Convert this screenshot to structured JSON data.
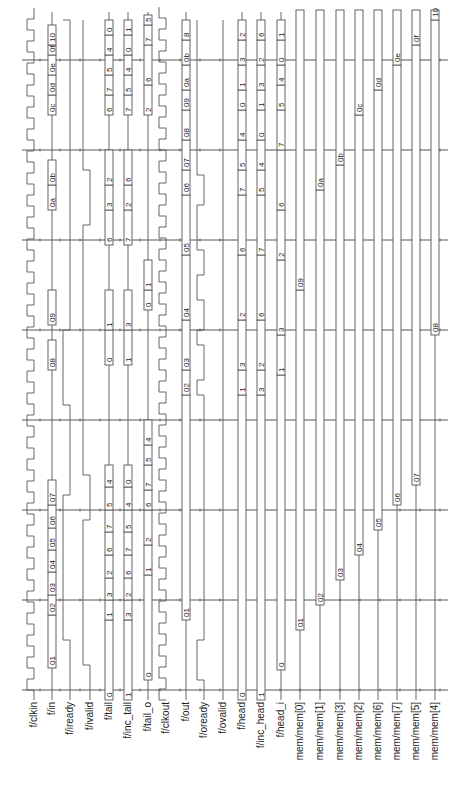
{
  "diagram": {
    "type": "timing-waveform",
    "orientation": "rotated-90-ccw",
    "time_axis_y_bottom": 690,
    "time_axis_y_top": 55,
    "cycle_height": 45,
    "grid_lines_y": [
      690,
      600,
      510,
      420,
      330,
      240,
      150,
      60
    ],
    "label_y": 700,
    "signals": [
      {
        "name": "f/clkin",
        "x": 34,
        "kind": "clock",
        "offset": 0
      },
      {
        "name": "f/in",
        "x": 52,
        "kind": "bus",
        "values": [
          {
            "v": "01",
            "y0": 668,
            "y1": 615
          },
          {
            "v": "02",
            "y0": 615,
            "y1": 595
          },
          {
            "v": "03",
            "y0": 595,
            "y1": 572
          },
          {
            "v": "04",
            "y0": 572,
            "y1": 550
          },
          {
            "v": "05",
            "y0": 550,
            "y1": 528
          },
          {
            "v": "06",
            "y0": 528,
            "y1": 505
          },
          {
            "v": "07",
            "y0": 505,
            "y1": 480
          },
          {
            "v": "08",
            "y0": 370,
            "y1": 340
          },
          {
            "v": "09",
            "y0": 325,
            "y1": 290
          },
          {
            "v": "0a",
            "y0": 210,
            "y1": 185
          },
          {
            "v": "0b",
            "y0": 185,
            "y1": 160
          },
          {
            "v": "0c",
            "y0": 115,
            "y1": 95
          },
          {
            "v": "0d",
            "y0": 95,
            "y1": 75
          },
          {
            "v": "0e",
            "y0": 75,
            "y1": 55
          },
          {
            "v": "0f",
            "y0": 55,
            "y1": 45
          },
          {
            "v": "10",
            "y0": 45,
            "y1": 25
          }
        ]
      },
      {
        "name": "f/iready",
        "x": 70,
        "kind": "level"
      },
      {
        "name": "f/ivalid",
        "x": 90,
        "kind": "level"
      },
      {
        "name": "f/tail",
        "x": 109,
        "kind": "bus",
        "values": [
          {
            "v": "0",
            "y0": 700,
            "y1": 620
          },
          {
            "v": "1",
            "y0": 620,
            "y1": 600
          },
          {
            "v": "3",
            "y0": 600,
            "y1": 578
          },
          {
            "v": "2",
            "y0": 578,
            "y1": 555
          },
          {
            "v": "6",
            "y0": 555,
            "y1": 532
          },
          {
            "v": "7",
            "y0": 532,
            "y1": 510
          },
          {
            "v": "5",
            "y0": 510,
            "y1": 487
          },
          {
            "v": "4",
            "y0": 487,
            "y1": 465
          },
          {
            "v": "0",
            "y0": 365,
            "y1": 330
          },
          {
            "v": "1",
            "y0": 330,
            "y1": 290
          },
          {
            "v": "6",
            "y0": 245,
            "y1": 210
          },
          {
            "v": "3",
            "y0": 210,
            "y1": 185
          },
          {
            "v": "2",
            "y0": 185,
            "y1": 150
          },
          {
            "v": "6",
            "y0": 115,
            "y1": 95
          },
          {
            "v": "7",
            "y0": 95,
            "y1": 75
          },
          {
            "v": "5",
            "y0": 75,
            "y1": 55
          },
          {
            "v": "4",
            "y0": 55,
            "y1": 35
          },
          {
            "v": "0",
            "y0": 35,
            "y1": 20
          }
        ]
      },
      {
        "name": "f/inc_tail",
        "x": 128,
        "kind": "bus",
        "values": [
          {
            "v": "1",
            "y0": 700,
            "y1": 620
          },
          {
            "v": "3",
            "y0": 620,
            "y1": 600
          },
          {
            "v": "2",
            "y0": 600,
            "y1": 578
          },
          {
            "v": "6",
            "y0": 578,
            "y1": 555
          },
          {
            "v": "7",
            "y0": 555,
            "y1": 532
          },
          {
            "v": "5",
            "y0": 532,
            "y1": 510
          },
          {
            "v": "4",
            "y0": 510,
            "y1": 487
          },
          {
            "v": "0",
            "y0": 487,
            "y1": 465
          },
          {
            "v": "1",
            "y0": 365,
            "y1": 330
          },
          {
            "v": "3",
            "y0": 330,
            "y1": 290
          },
          {
            "v": "7",
            "y0": 245,
            "y1": 210
          },
          {
            "v": "2",
            "y0": 210,
            "y1": 185
          },
          {
            "v": "6",
            "y0": 185,
            "y1": 150
          },
          {
            "v": "7",
            "y0": 115,
            "y1": 95
          },
          {
            "v": "5",
            "y0": 95,
            "y1": 75
          },
          {
            "v": "4",
            "y0": 75,
            "y1": 55
          },
          {
            "v": "0",
            "y0": 55,
            "y1": 35
          },
          {
            "v": "1",
            "y0": 35,
            "y1": 20
          }
        ]
      },
      {
        "name": "f/tail_o",
        "x": 148,
        "kind": "bus",
        "values": [
          {
            "v": "0",
            "y0": 680,
            "y1": 575
          },
          {
            "v": "1",
            "y0": 575,
            "y1": 545
          },
          {
            "v": "2",
            "y0": 545,
            "y1": 510
          },
          {
            "v": "6",
            "y0": 510,
            "y1": 490
          },
          {
            "v": "7",
            "y0": 490,
            "y1": 465
          },
          {
            "v": "5",
            "y0": 465,
            "y1": 445
          },
          {
            "v": "4",
            "y0": 445,
            "y1": 420
          },
          {
            "v": "0",
            "y0": 310,
            "y1": 290
          },
          {
            "v": "1",
            "y0": 290,
            "y1": 260
          },
          {
            "v": "2",
            "y0": 115,
            "y1": 85
          },
          {
            "v": "6",
            "y0": 85,
            "y1": 45
          },
          {
            "v": "7",
            "y0": 45,
            "y1": 25
          },
          {
            "v": "5",
            "y0": 25,
            "y1": 15
          }
        ]
      },
      {
        "name": "f/clkout",
        "x": 166,
        "kind": "clock",
        "offset": 10
      },
      {
        "name": "f/out",
        "x": 186,
        "kind": "bus",
        "values": [
          {
            "v": "01",
            "y0": 620,
            "y1": 395
          },
          {
            "v": "02",
            "y0": 395,
            "y1": 370
          },
          {
            "v": "03",
            "y0": 370,
            "y1": 320
          },
          {
            "v": "04",
            "y0": 320,
            "y1": 255
          },
          {
            "v": "05",
            "y0": 255,
            "y1": 195
          },
          {
            "v": "06",
            "y0": 195,
            "y1": 170
          },
          {
            "v": "07",
            "y0": 170,
            "y1": 140
          },
          {
            "v": "08",
            "y0": 140,
            "y1": 110
          },
          {
            "v": "09",
            "y0": 110,
            "y1": 90
          },
          {
            "v": "0a",
            "y0": 90,
            "y1": 65
          },
          {
            "v": "0b",
            "y0": 65,
            "y1": 40
          },
          {
            "v": "8",
            "y0": 40,
            "y1": 20
          }
        ]
      },
      {
        "name": "f/oready",
        "x": 204,
        "kind": "level"
      },
      {
        "name": "f/ovalid",
        "x": 223,
        "kind": "level"
      },
      {
        "name": "f/head",
        "x": 242,
        "kind": "bus",
        "values": [
          {
            "v": "0",
            "y0": 700,
            "y1": 395
          },
          {
            "v": "1",
            "y0": 395,
            "y1": 370
          },
          {
            "v": "3",
            "y0": 370,
            "y1": 320
          },
          {
            "v": "2",
            "y0": 320,
            "y1": 255
          },
          {
            "v": "6",
            "y0": 255,
            "y1": 195
          },
          {
            "v": "7",
            "y0": 195,
            "y1": 170
          },
          {
            "v": "5",
            "y0": 170,
            "y1": 140
          },
          {
            "v": "4",
            "y0": 140,
            "y1": 110
          },
          {
            "v": "0",
            "y0": 110,
            "y1": 90
          },
          {
            "v": "1",
            "y0": 90,
            "y1": 65
          },
          {
            "v": "3",
            "y0": 65,
            "y1": 40
          },
          {
            "v": "2",
            "y0": 40,
            "y1": 20
          }
        ]
      },
      {
        "name": "f/inc_head",
        "x": 261,
        "kind": "bus",
        "values": [
          {
            "v": "1",
            "y0": 700,
            "y1": 395
          },
          {
            "v": "3",
            "y0": 395,
            "y1": 370
          },
          {
            "v": "2",
            "y0": 370,
            "y1": 320
          },
          {
            "v": "6",
            "y0": 320,
            "y1": 255
          },
          {
            "v": "7",
            "y0": 255,
            "y1": 195
          },
          {
            "v": "5",
            "y0": 195,
            "y1": 170
          },
          {
            "v": "4",
            "y0": 170,
            "y1": 140
          },
          {
            "v": "0",
            "y0": 140,
            "y1": 110
          },
          {
            "v": "1",
            "y0": 110,
            "y1": 90
          },
          {
            "v": "3",
            "y0": 90,
            "y1": 65
          },
          {
            "v": "2",
            "y0": 65,
            "y1": 40
          },
          {
            "v": "6",
            "y0": 40,
            "y1": 20
          }
        ]
      },
      {
        "name": "f/head_i",
        "x": 281,
        "kind": "bus",
        "values": [
          {
            "v": "0",
            "y0": 670,
            "y1": 375
          },
          {
            "v": "1",
            "y0": 375,
            "y1": 335
          },
          {
            "v": "3",
            "y0": 335,
            "y1": 260
          },
          {
            "v": "2",
            "y0": 260,
            "y1": 210
          },
          {
            "v": "6",
            "y0": 210,
            "y1": 150
          },
          {
            "v": "7",
            "y0": 150,
            "y1": 110
          },
          {
            "v": "5",
            "y0": 110,
            "y1": 85
          },
          {
            "v": "4",
            "y0": 85,
            "y1": 65
          },
          {
            "v": "0",
            "y0": 65,
            "y1": 40
          },
          {
            "v": "1",
            "y0": 40,
            "y1": 20
          }
        ]
      },
      {
        "name": "mem/mem[0]",
        "x": 300,
        "kind": "bus",
        "values": [
          {
            "v": "01",
            "y0": 630,
            "y1": 290
          },
          {
            "v": "09",
            "y0": 290,
            "y1": 10
          }
        ]
      },
      {
        "name": "mem/mem[1]",
        "x": 320,
        "kind": "bus",
        "values": [
          {
            "v": "02",
            "y0": 605,
            "y1": 190
          },
          {
            "v": "0a",
            "y0": 190,
            "y1": 10
          }
        ]
      },
      {
        "name": "mem/mem[3]",
        "x": 340,
        "kind": "bus",
        "values": [
          {
            "v": "03",
            "y0": 580,
            "y1": 165
          },
          {
            "v": "0b",
            "y0": 165,
            "y1": 10
          }
        ]
      },
      {
        "name": "mem/mem[2]",
        "x": 359,
        "kind": "bus",
        "values": [
          {
            "v": "04",
            "y0": 555,
            "y1": 115
          },
          {
            "v": "0c",
            "y0": 115,
            "y1": 10
          }
        ]
      },
      {
        "name": "mem/mem[6]",
        "x": 378,
        "kind": "bus",
        "values": [
          {
            "v": "05",
            "y0": 530,
            "y1": 90
          },
          {
            "v": "0d",
            "y0": 90,
            "y1": 10
          }
        ]
      },
      {
        "name": "mem/mem[7]",
        "x": 397,
        "kind": "bus",
        "values": [
          {
            "v": "06",
            "y0": 505,
            "y1": 65
          },
          {
            "v": "0e",
            "y0": 65,
            "y1": 10
          }
        ]
      },
      {
        "name": "mem/mem[5]",
        "x": 416,
        "kind": "bus",
        "values": [
          {
            "v": "07",
            "y0": 485,
            "y1": 45
          },
          {
            "v": "0f",
            "y0": 45,
            "y1": 10
          }
        ]
      },
      {
        "name": "mem/mem[4]",
        "x": 435,
        "kind": "bus",
        "values": [
          {
            "v": "08",
            "y0": 335,
            "y1": 20
          },
          {
            "v": "10",
            "y0": 20,
            "y1": 10
          }
        ]
      }
    ],
    "level_paths": {
      "f/iready": [
        [
          70,
          700
        ],
        [
          70,
          640
        ],
        [
          63,
          640
        ],
        [
          63,
          495
        ],
        [
          70,
          495
        ],
        [
          70,
          405
        ],
        [
          63,
          405
        ],
        [
          63,
          330
        ],
        [
          70,
          330
        ],
        [
          70,
          20
        ],
        [
          63,
          20
        ]
      ],
      "f/ivalid": [
        [
          90,
          700
        ],
        [
          90,
          665
        ],
        [
          83,
          665
        ],
        [
          83,
          520
        ],
        [
          90,
          520
        ],
        [
          90,
          475
        ],
        [
          83,
          475
        ],
        [
          83,
          225
        ],
        [
          90,
          225
        ],
        [
          90,
          170
        ],
        [
          83,
          170
        ],
        [
          83,
          20
        ]
      ],
      "f/oready": [
        [
          204,
          700
        ],
        [
          204,
          680
        ],
        [
          197,
          680
        ],
        [
          197,
          640
        ],
        [
          204,
          640
        ],
        [
          204,
          395
        ],
        [
          197,
          395
        ],
        [
          197,
          380
        ],
        [
          204,
          380
        ],
        [
          204,
          345
        ],
        [
          197,
          345
        ],
        [
          197,
          330
        ],
        [
          204,
          330
        ],
        [
          204,
          300
        ],
        [
          197,
          300
        ],
        [
          197,
          275
        ],
        [
          204,
          275
        ],
        [
          204,
          250
        ],
        [
          197,
          250
        ],
        [
          197,
          205
        ],
        [
          204,
          205
        ],
        [
          204,
          175
        ],
        [
          197,
          175
        ],
        [
          197,
          20
        ]
      ],
      "f/ovalid": [
        [
          223,
          700
        ],
        [
          223,
          20
        ]
      ]
    }
  }
}
